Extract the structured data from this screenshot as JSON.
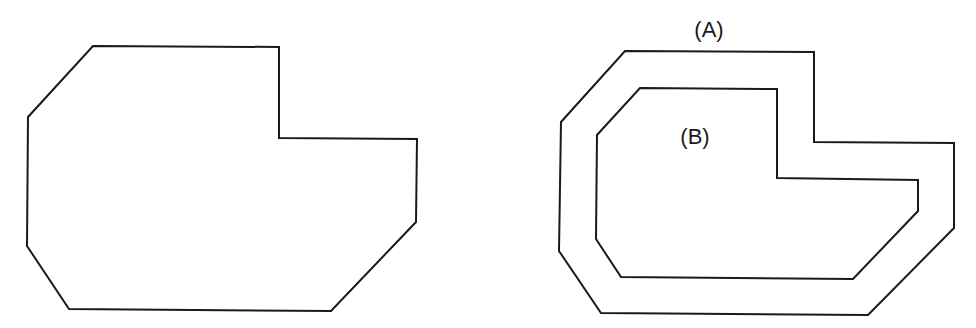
{
  "diagram": {
    "stroke_color": "#1a1a1a",
    "background": "#ffffff",
    "left_shape": {
      "points": "93,46 279,47 279,138 417,139 416,222 331,311 69,309 27,246 28,117"
    },
    "right_shapes": {
      "outer": {
        "label": "(A)",
        "points": "625,51 814,52 814,142 954,143 954,228 868,315 601,313 559,251 561,122"
      },
      "inner": {
        "label": "(B)",
        "points": "640,88 777,89 777,178 918,180 918,211 853,279 621,277 596,239 597,135"
      }
    }
  }
}
